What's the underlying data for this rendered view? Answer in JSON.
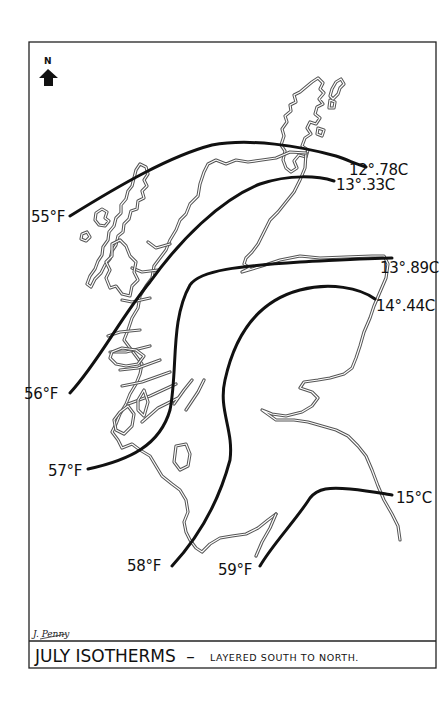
{
  "map": {
    "title": "JULY ISOTHERMS",
    "title_separator": "–",
    "subtitle": "LAYERED SOUTH TO NORTH.",
    "signature": "J. Penny",
    "north_label": "N",
    "north_icon": "north-arrow-icon",
    "region": "Scotland",
    "colors": {
      "ink": "#111111",
      "coast": "#555555",
      "background": "#ffffff"
    }
  },
  "isotherms": [
    {
      "fahrenheit": "55°F",
      "celsius": "12°.78C"
    },
    {
      "fahrenheit": "56°F",
      "celsius": "13°.33C"
    },
    {
      "fahrenheit": "57°F",
      "celsius": "13°.89C"
    },
    {
      "fahrenheit": "58°F",
      "celsius": "14°.44C"
    },
    {
      "fahrenheit": "59°F",
      "celsius": "15°C"
    }
  ]
}
